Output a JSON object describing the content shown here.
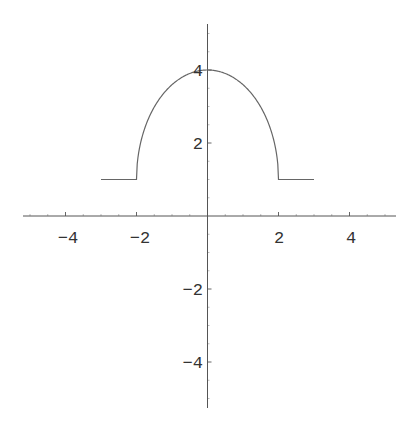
{
  "chart_data": {
    "type": "line",
    "title": "",
    "xlabel": "",
    "ylabel": "",
    "xlim": [
      -5.2,
      5.2
    ],
    "ylim": [
      -5.2,
      5.2
    ],
    "grid": false,
    "legend": null,
    "x_ticks": [
      -4,
      -2,
      2,
      4
    ],
    "y_ticks": [
      -4,
      -2,
      2,
      4
    ],
    "x_tick_labels": [
      "−4",
      "−2",
      "2",
      "4"
    ],
    "y_tick_labels": [
      "−4",
      "−2",
      "2",
      "4"
    ],
    "series": [
      {
        "name": "piecewise function",
        "description": "y = 1 for -3<=x<-2 and 2<x<=3; y = 1 + 1.5*sqrt(4 - x^2) for -2<=x<=2",
        "x": [
          -3,
          -2,
          -1.9,
          -1.75,
          -1.5,
          -1,
          -0.5,
          0,
          0.5,
          1,
          1.5,
          1.75,
          1.9,
          2,
          3
        ],
        "y": [
          1,
          1,
          1.94,
          2.45,
          2.98,
          3.6,
          3.9,
          4,
          3.9,
          3.6,
          2.98,
          2.45,
          1.94,
          1,
          1
        ]
      }
    ]
  },
  "axes": {
    "x_labels": [
      "−4",
      "−2",
      "2",
      "4"
    ],
    "y_labels": [
      "4",
      "2",
      "−2",
      "−4"
    ]
  },
  "colors": {
    "curve": "#666666",
    "axis": "#555555",
    "text": "#333333",
    "background": "#ffffff"
  }
}
